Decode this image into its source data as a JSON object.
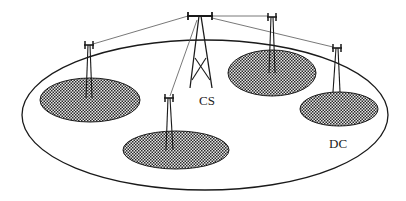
{
  "diagram": {
    "type": "cellular-network-schematic",
    "labels": {
      "central_station": "CS",
      "data_cell": "DC"
    },
    "colors": {
      "stroke": "#1a1a1a",
      "link": "#555555",
      "background": "#ffffff",
      "cell_dark": "#2a2a2a",
      "cell_light": "#e8e8e8"
    },
    "outer_region": {
      "cx": 205,
      "cy": 115,
      "rx": 183,
      "ry": 75
    },
    "cells": [
      {
        "id": "cell-left",
        "cx": 90,
        "cy": 100,
        "rx": 50,
        "ry": 22,
        "antenna": {
          "x": 89,
          "y": 45
        }
      },
      {
        "id": "cell-bottom",
        "cx": 176,
        "cy": 150,
        "rx": 53,
        "ry": 19,
        "antenna": {
          "x": 169,
          "y": 97
        }
      },
      {
        "id": "cell-top-right",
        "cx": 272,
        "cy": 73,
        "rx": 44,
        "ry": 23,
        "antenna": {
          "x": 272,
          "y": 17
        }
      },
      {
        "id": "cell-right-dc",
        "cx": 339,
        "cy": 109,
        "rx": 39,
        "ry": 17,
        "antenna": {
          "x": 337,
          "y": 48
        }
      }
    ],
    "central_tower": {
      "x": 200,
      "y": 16,
      "bar_half_width": 13,
      "base_y": 88
    }
  }
}
